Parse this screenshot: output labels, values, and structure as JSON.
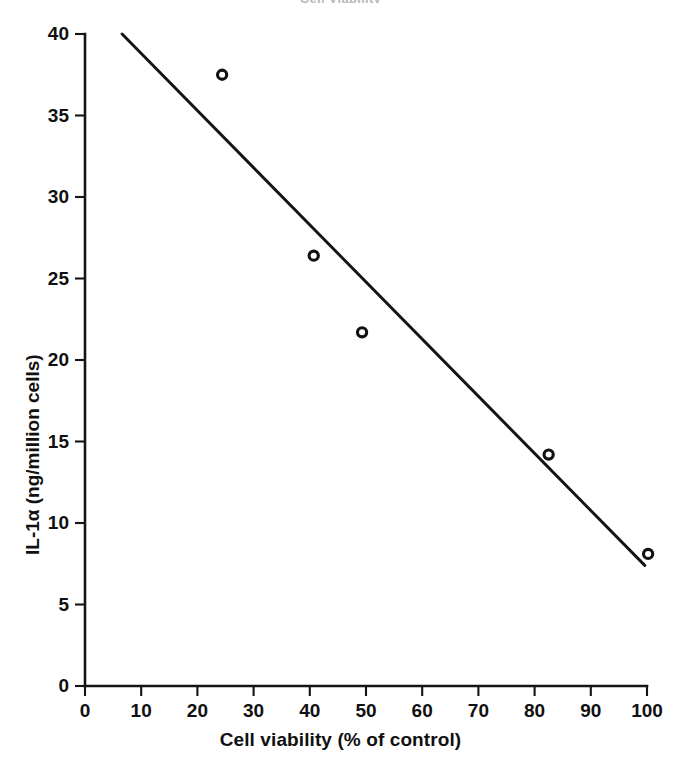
{
  "chart_data": {
    "type": "scatter",
    "title": "Cell Viability",
    "title_cropped": true,
    "xlabel": "Cell viability (% of control)",
    "ylabel": "IL-1α (ng/million cells)",
    "xlim": [
      0,
      100
    ],
    "ylim": [
      0,
      40
    ],
    "xticks": [
      0,
      10,
      20,
      30,
      40,
      50,
      60,
      70,
      80,
      90,
      100
    ],
    "yticks": [
      0,
      5,
      10,
      15,
      20,
      25,
      30,
      35,
      40
    ],
    "xtick_labels": [
      "0",
      "10",
      "20",
      "30",
      "40",
      "50",
      "60",
      "70",
      "80",
      "90",
      "100"
    ],
    "ytick_labels": [
      "0",
      "5",
      "10",
      "15",
      "20",
      "25",
      "30",
      "35",
      "40"
    ],
    "grid": false,
    "legend": false,
    "marker": "open-circle",
    "series": [
      {
        "name": "IL-1α vs cell viability",
        "x": [
          24.4,
          40.7,
          49.3,
          82.5,
          100.2
        ],
        "y": [
          37.5,
          26.4,
          21.7,
          14.2,
          8.1
        ]
      }
    ],
    "trend_line": {
      "name": "linear regression",
      "x": [
        6.6,
        99.6
      ],
      "y": [
        40.0,
        7.4
      ],
      "slope": -0.35,
      "intercept": 42.3
    },
    "colors": {
      "axis": "#141414",
      "marker": "#111111",
      "trend": "#141414",
      "background": "#ffffff"
    }
  },
  "axis": {
    "x_title": "Cell viability (% of control)",
    "y_title": "IL-1α (ng/million cells)"
  },
  "title": {
    "text": "Cell Viability"
  }
}
